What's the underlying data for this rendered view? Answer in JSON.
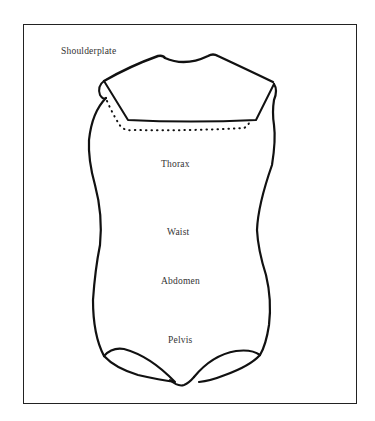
{
  "diagram": {
    "type": "garment/torso region outline",
    "labels": {
      "shoulderplate": "Shoulderplate",
      "thorax": "Thorax",
      "waist": "Waist",
      "abdomen": "Abdomen",
      "pelvis": "Pelvis"
    },
    "colors": {
      "stroke": "#111111",
      "text": "#333333",
      "background": "#ffffff"
    }
  }
}
